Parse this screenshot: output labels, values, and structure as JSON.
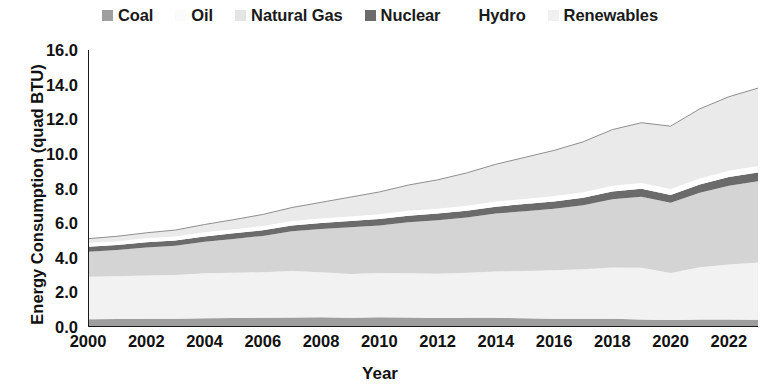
{
  "chart_data": {
    "type": "area",
    "stacked": true,
    "title": "",
    "xlabel": "Year",
    "ylabel": "Energy Consumption (quad BTU)",
    "xlim": [
      2000,
      2023
    ],
    "ylim": [
      0.0,
      16.0
    ],
    "ytick_labels": [
      "0.0",
      "2.0",
      "4.0",
      "6.0",
      "8.0",
      "10.0",
      "12.0",
      "14.0",
      "16.0"
    ],
    "ytick_values": [
      0,
      2,
      4,
      6,
      8,
      10,
      12,
      14,
      16
    ],
    "xtick_labels": [
      "2000",
      "2002",
      "2004",
      "2006",
      "2008",
      "2010",
      "2012",
      "2014",
      "2016",
      "2018",
      "2020",
      "2022"
    ],
    "xtick_values": [
      2000,
      2002,
      2004,
      2006,
      2008,
      2010,
      2012,
      2014,
      2016,
      2018,
      2020,
      2022
    ],
    "grid": false,
    "legend_position": "top",
    "x": [
      2000,
      2001,
      2002,
      2003,
      2004,
      2005,
      2006,
      2007,
      2008,
      2009,
      2010,
      2011,
      2012,
      2013,
      2014,
      2015,
      2016,
      2017,
      2018,
      2019,
      2020,
      2021,
      2022,
      2023
    ],
    "series": [
      {
        "name": "Coal",
        "color": "#9e9e9e",
        "values": [
          0.45,
          0.46,
          0.47,
          0.48,
          0.5,
          0.52,
          0.53,
          0.55,
          0.56,
          0.54,
          0.56,
          0.55,
          0.52,
          0.53,
          0.54,
          0.5,
          0.48,
          0.47,
          0.47,
          0.44,
          0.4,
          0.43,
          0.43,
          0.42
        ]
      },
      {
        "name": "Oil",
        "color": "#f2f2f2",
        "values": [
          2.45,
          2.47,
          2.5,
          2.52,
          2.6,
          2.62,
          2.63,
          2.68,
          2.6,
          2.52,
          2.56,
          2.55,
          2.55,
          2.6,
          2.66,
          2.74,
          2.8,
          2.86,
          2.96,
          2.98,
          2.72,
          3.02,
          3.18,
          3.3
        ]
      },
      {
        "name": "Natural Gas",
        "color": "#d4d4d4",
        "values": [
          1.45,
          1.52,
          1.62,
          1.7,
          1.82,
          1.95,
          2.1,
          2.3,
          2.5,
          2.7,
          2.75,
          2.95,
          3.1,
          3.2,
          3.35,
          3.45,
          3.55,
          3.7,
          3.95,
          4.1,
          4.05,
          4.3,
          4.55,
          4.7
        ]
      },
      {
        "name": "Nuclear",
        "color": "#6b6b6b",
        "values": [
          0.28,
          0.29,
          0.3,
          0.3,
          0.31,
          0.32,
          0.33,
          0.34,
          0.35,
          0.36,
          0.37,
          0.38,
          0.38,
          0.39,
          0.4,
          0.41,
          0.42,
          0.43,
          0.45,
          0.46,
          0.46,
          0.48,
          0.5,
          0.51
        ]
      },
      {
        "name": "Hydro",
        "color": "#ffffff",
        "values": [
          0.22,
          0.22,
          0.23,
          0.23,
          0.24,
          0.24,
          0.25,
          0.25,
          0.26,
          0.26,
          0.27,
          0.28,
          0.28,
          0.29,
          0.3,
          0.3,
          0.31,
          0.32,
          0.33,
          0.34,
          0.34,
          0.35,
          0.36,
          0.37
        ]
      },
      {
        "name": "Renewables",
        "color": "#eaeaea",
        "values": [
          0.25,
          0.28,
          0.32,
          0.37,
          0.45,
          0.55,
          0.66,
          0.78,
          0.93,
          1.12,
          1.29,
          1.49,
          1.67,
          1.89,
          2.15,
          2.4,
          2.64,
          2.92,
          3.24,
          3.48,
          3.63,
          4.02,
          4.28,
          4.5
        ]
      }
    ],
    "totals": [
      5.1,
      5.24,
      5.44,
      5.6,
      5.92,
      6.2,
      6.5,
      6.9,
      7.2,
      7.5,
      7.8,
      8.2,
      8.5,
      8.9,
      9.4,
      9.8,
      10.2,
      10.7,
      11.4,
      11.8,
      11.6,
      12.6,
      13.3,
      13.8
    ]
  },
  "legend": {
    "items": [
      {
        "label": "Coal",
        "swatch": "#9e9e9e"
      },
      {
        "label": "Oil",
        "swatch": "#fbfbfb"
      },
      {
        "label": "Natural Gas",
        "swatch": "#e4e4e4"
      },
      {
        "label": "Nuclear",
        "swatch": "#6b6b6b"
      },
      {
        "label": "Hydro",
        "swatch": "#ffffff"
      },
      {
        "label": "Renewables",
        "swatch": "#f0f0f0"
      }
    ]
  }
}
